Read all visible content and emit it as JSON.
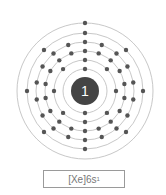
{
  "element": {
    "symbol_label": "1",
    "electron_configuration_base": "[Xe]6s",
    "electron_configuration_sup": "1",
    "shells": [
      2,
      8,
      18,
      18,
      8,
      1
    ]
  },
  "layout": {
    "center": [
      85,
      91
    ],
    "nucleus_radius": 14,
    "shell_radii": [
      22,
      31,
      40,
      49,
      58,
      68
    ],
    "colors": {
      "nucleus": "#444444",
      "electron": "#555555",
      "ring": "#c8c8c8",
      "label": "#ffffff"
    }
  }
}
